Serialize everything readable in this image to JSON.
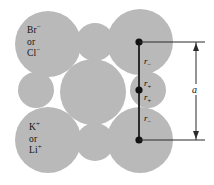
{
  "figure": {
    "type": "ionic-crystal-lattice-cross-section",
    "width": 214,
    "height": 185,
    "background_color": "#ffffff",
    "ion_fill_color": "#b9b9b9",
    "line_color": "#2b2b2b",
    "dot_color": "#111111",
    "text_color": "#141414"
  },
  "labels": {
    "anion": {
      "line1": "Br",
      "line1_charge": "−",
      "line2": "or",
      "line3": "Cl",
      "line3_charge": "−"
    },
    "cation": {
      "line1": "K",
      "line1_charge": "+",
      "line2": "or",
      "line3": "Li",
      "line3_charge": "+"
    }
  },
  "measurements": {
    "r_minus_top": {
      "symbol": "r",
      "subscript": "−"
    },
    "r_plus_upper": {
      "symbol": "r",
      "subscript": "+"
    },
    "r_plus_lower": {
      "symbol": "r",
      "subscript": "+"
    },
    "r_minus_bottom": {
      "symbol": "r",
      "subscript": "−"
    },
    "lattice_constant": {
      "symbol": "a"
    }
  },
  "circles": [
    {
      "name": "anion-top-left",
      "cx": 48,
      "cy": 44,
      "r": 33,
      "species": "anion"
    },
    {
      "name": "cation-top-center",
      "cx": 95,
      "cy": 42,
      "r": 19,
      "species": "cation"
    },
    {
      "name": "anion-top-right",
      "cx": 140,
      "cy": 42,
      "r": 33,
      "species": "anion"
    },
    {
      "name": "cation-mid-left",
      "cx": 36,
      "cy": 90,
      "r": 18,
      "species": "cation"
    },
    {
      "name": "anion-mid-center",
      "cx": 93,
      "cy": 92,
      "r": 33,
      "species": "anion"
    },
    {
      "name": "cation-mid-right",
      "cx": 148,
      "cy": 90,
      "r": 18,
      "species": "cation"
    },
    {
      "name": "anion-bottom-left",
      "cx": 48,
      "cy": 140,
      "r": 33,
      "species": "anion"
    },
    {
      "name": "cation-bottom-center",
      "cx": 95,
      "cy": 142,
      "r": 19,
      "species": "cation"
    },
    {
      "name": "anion-bottom-right",
      "cx": 140,
      "cy": 140,
      "r": 33,
      "species": "anion"
    }
  ],
  "vertical_axis": {
    "x": 139,
    "y_top": 42,
    "y_mid": 90,
    "y_bottom": 140
  },
  "dimension_line": {
    "x": 196,
    "y_top": 42,
    "y_bottom": 140
  }
}
